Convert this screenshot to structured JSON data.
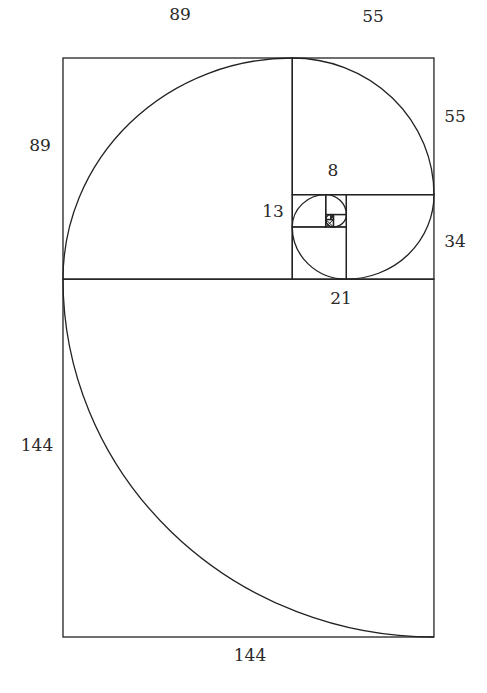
{
  "diagram": {
    "stroke_color": "#222222",
    "background": "#ffffff",
    "frame": {
      "left_px": 63,
      "top_px": 58,
      "width_units": 144,
      "height_units": 233,
      "px_per_unit_x": 2.576,
      "px_per_unit_y": 2.485
    },
    "squares": [
      {
        "size": 144,
        "x": 0,
        "y": 89,
        "w": 144,
        "h": 144
      },
      {
        "size": 89,
        "x": 0,
        "y": 0,
        "w": 89,
        "h": 89
      },
      {
        "size": 55,
        "x": 89,
        "y": 0,
        "w": 55,
        "h": 55
      },
      {
        "size": 34,
        "x": 110,
        "y": 55,
        "w": 34,
        "h": 34
      },
      {
        "size": 21,
        "x": 89,
        "y": 68,
        "w": 21,
        "h": 21
      },
      {
        "size": 13,
        "x": 89,
        "y": 55,
        "w": 13,
        "h": 13
      },
      {
        "size": 8,
        "x": 102,
        "y": 55,
        "w": 8,
        "h": 8
      },
      {
        "size": 5,
        "x": 105,
        "y": 63,
        "w": 5,
        "h": 5
      },
      {
        "size": 3,
        "x": 102,
        "y": 65,
        "w": 3,
        "h": 3
      },
      {
        "size": 2,
        "x": 102,
        "y": 63,
        "w": 2,
        "h": 2
      },
      {
        "size": 1,
        "x": 104,
        "y": 63,
        "w": 1,
        "h": 1
      },
      {
        "size": 1,
        "x": 104,
        "y": 64,
        "w": 1,
        "h": 1
      }
    ],
    "labels": [
      {
        "id": "top-89",
        "text": "89",
        "x": 180,
        "y": 14
      },
      {
        "id": "top-55",
        "text": "55",
        "x": 373,
        "y": 16
      },
      {
        "id": "left-89",
        "text": "89",
        "x": 40,
        "y": 145
      },
      {
        "id": "right-55",
        "text": "55",
        "x": 455,
        "y": 116
      },
      {
        "id": "inner-8",
        "text": "8",
        "x": 333,
        "y": 170
      },
      {
        "id": "inner-13",
        "text": "13",
        "x": 273,
        "y": 211
      },
      {
        "id": "right-34",
        "text": "34",
        "x": 455,
        "y": 241
      },
      {
        "id": "bottom-21",
        "text": "21",
        "x": 341,
        "y": 298
      },
      {
        "id": "left-144",
        "text": "144",
        "x": 37,
        "y": 445
      },
      {
        "id": "bottom-144",
        "text": "144",
        "x": 250,
        "y": 655
      }
    ]
  }
}
